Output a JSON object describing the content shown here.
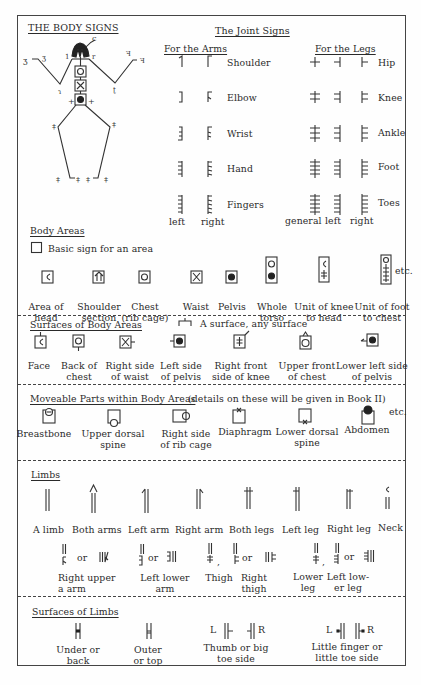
{
  "title": "THE BODY SIGNS",
  "joint_signs": {
    "heading": "The Joint Signs",
    "arms_heading": "For the Arms",
    "legs_heading": "For the Legs",
    "rows": [
      {
        "label_arm": "Shoulder",
        "label_leg": "Hip"
      },
      {
        "label_arm": "Elbow",
        "label_leg": "Knee"
      },
      {
        "label_arm": "Wrist",
        "label_leg": "Ankle"
      },
      {
        "label_arm": "Hand",
        "label_leg": "Foot"
      },
      {
        "label_arm": "Fingers",
        "label_leg": "Toes"
      }
    ],
    "arm_columns": [
      "left",
      "right"
    ],
    "leg_columns": [
      "general",
      "left",
      "right"
    ]
  },
  "body_areas": {
    "heading": "Body Areas",
    "basic_sign": "Basic sign for an area",
    "items": [
      {
        "line1": "Area of",
        "line2": "head"
      },
      {
        "line1": "Shoulder",
        "line2": "section"
      },
      {
        "line1": "Chest",
        "line2": "(rib cage)"
      },
      {
        "line1": "Waist",
        "line2": ""
      },
      {
        "line1": "Pelvis",
        "line2": ""
      },
      {
        "line1": "Whole",
        "line2": "torso"
      },
      {
        "line1": "Unit of knee",
        "line2": "to head"
      },
      {
        "line1": "Unit of foot",
        "line2": "to chest"
      }
    ],
    "etc": "etc."
  },
  "surfaces_body_areas": {
    "heading": "Surfaces of Body Areas",
    "note": "A surface, any surface",
    "items": [
      {
        "line1": "Face",
        "line2": ""
      },
      {
        "line1": "Back of",
        "line2": "chest"
      },
      {
        "line1": "Right side",
        "line2": "of waist"
      },
      {
        "line1": "Left side",
        "line2": "of pelvis"
      },
      {
        "line1": "Right front",
        "line2": "side of knee"
      },
      {
        "line1": "Upper front",
        "line2": "of chest"
      },
      {
        "line1": "Lower left side",
        "line2": "of pelvis"
      }
    ]
  },
  "moveable_parts": {
    "heading": "Moveable Parts within Body Areas",
    "note": "(details on these will be given in Book II)",
    "items": [
      {
        "line1": "Breastbone",
        "line2": ""
      },
      {
        "line1": "Upper dorsal",
        "line2": "spine"
      },
      {
        "line1": "Right side",
        "line2": "of rib cage"
      },
      {
        "line1": "Diaphragm",
        "line2": ""
      },
      {
        "line1": "Lower dorsal",
        "line2": "spine"
      },
      {
        "line1": "Abdomen",
        "line2": ""
      }
    ],
    "etc": "etc."
  },
  "limbs": {
    "heading": "Limbs",
    "items": [
      "A limb",
      "Both arms",
      "Left arm",
      "Right arm",
      "Both legs",
      "Left leg",
      "Right leg",
      "Neck"
    ],
    "or": "or",
    "comma": ",",
    "sub_items": [
      {
        "line1": "Right upper",
        "line2": "a   arm"
      },
      {
        "line1": "Left lower",
        "line2": "arm"
      },
      {
        "line1": "Thigh",
        "line2": ""
      },
      {
        "line1": "Right",
        "line2": "thigh"
      },
      {
        "line1": "Lower",
        "line2": "leg"
      },
      {
        "line1": "Left low-",
        "line2": "er leg"
      }
    ]
  },
  "surfaces_limbs": {
    "heading": "Surfaces of Limbs",
    "L": "L",
    "R": "R",
    "items": [
      {
        "line1": "Under or",
        "line2": "back"
      },
      {
        "line1": "Outer",
        "line2": "or top"
      },
      {
        "line1": "Thumb or big",
        "line2": "toe side"
      },
      {
        "line1": "Little finger or",
        "line2": "little toe side"
      }
    ]
  }
}
